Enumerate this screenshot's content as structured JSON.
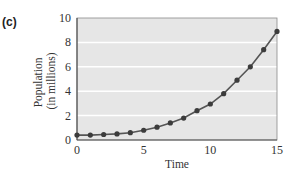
{
  "panel_label": "(c)",
  "chart_data": {
    "type": "line",
    "title": "",
    "xlabel": "Time",
    "ylabel": "Population (in millions)",
    "ylabel_lines": [
      "Population",
      "(in millions)"
    ],
    "x": [
      0,
      1,
      2,
      3,
      4,
      5,
      6,
      7,
      8,
      9,
      10,
      11,
      12,
      13,
      14,
      15
    ],
    "series": [
      {
        "name": "Population",
        "values": [
          0.4,
          0.4,
          0.45,
          0.5,
          0.6,
          0.8,
          1.05,
          1.4,
          1.8,
          2.4,
          2.95,
          3.8,
          4.9,
          6.0,
          7.4,
          8.9
        ],
        "marker": "circle"
      }
    ],
    "xlim": [
      0,
      15
    ],
    "ylim": [
      0,
      10
    ],
    "xticks": [
      "0",
      "5",
      "10",
      "15"
    ],
    "yticks": [
      "0",
      "2",
      "4",
      "6",
      "8",
      "10"
    ],
    "grid": true,
    "legend": "none",
    "colors": {
      "plot_bg": "#e6e6e6",
      "grid": "#ffffff",
      "line": "#555555",
      "marker": "#3c3c3c"
    }
  }
}
